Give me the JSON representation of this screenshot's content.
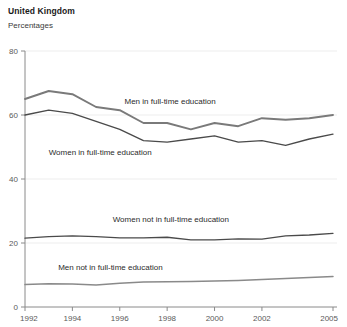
{
  "header": {
    "title": "United Kingdom",
    "subtitle": "Percentages"
  },
  "chart_data": {
    "type": "line",
    "title": "United Kingdom",
    "subtitle": "Percentages",
    "xlabel": "",
    "ylabel": "Percentages",
    "xlim": [
      1992,
      2005
    ],
    "ylim": [
      0,
      80
    ],
    "yticks": [
      0,
      20,
      40,
      60,
      80
    ],
    "xticks": [
      1992,
      1994,
      1996,
      1998,
      2000,
      2002,
      2005
    ],
    "xtick_labels": [
      "1992",
      "1994",
      "1996",
      "1998",
      "2000",
      "2002",
      "2005"
    ],
    "ytick_labels": [
      "0",
      "20",
      "40",
      "60",
      "80"
    ],
    "grid": true,
    "grid_axis": "y",
    "legend_position": "inline-annotations",
    "x": [
      1992,
      1993,
      1994,
      1995,
      1996,
      1997,
      1998,
      1999,
      2000,
      2001,
      2002,
      2003,
      2004,
      2005
    ],
    "series": [
      {
        "name": "Men in full-time education",
        "color": "#7a7a7a",
        "width": 1.9,
        "label_x": 1996.2,
        "label_y": 63.5,
        "values": [
          65,
          67.5,
          66.5,
          62.5,
          61.5,
          57.5,
          57.5,
          55.5,
          57.5,
          56.5,
          59,
          58.5,
          59,
          60
        ]
      },
      {
        "name": "Women in full-time education",
        "color": "#4a4a4a",
        "width": 1.3,
        "label_x": 1993.0,
        "label_y": 47.5,
        "values": [
          60,
          61.5,
          60.5,
          58,
          55.5,
          52,
          51.5,
          52.5,
          53.5,
          51.5,
          52,
          50.5,
          52.5,
          54
        ]
      },
      {
        "name": "Women not in full-time education",
        "color": "#4a4a4a",
        "width": 1.3,
        "label_x": 1995.7,
        "label_y": 26.5,
        "values": [
          21.5,
          22,
          22.2,
          22,
          21.6,
          21.6,
          21.8,
          21,
          21,
          21.3,
          21.2,
          22.2,
          22.5,
          23
        ]
      },
      {
        "name": "Men not in full-time education",
        "color": "#8a8a8a",
        "width": 1.5,
        "label_x": 1993.4,
        "label_y": 11.5,
        "values": [
          7,
          7.3,
          7.2,
          6.9,
          7.4,
          7.8,
          7.9,
          8.0,
          8.1,
          8.3,
          8.6,
          8.9,
          9.2,
          9.5
        ]
      }
    ]
  },
  "colors": {
    "axis": "#8a8a8a",
    "grid": "#ededed",
    "text": "#5a5a5a",
    "title": "#1a1a1a"
  }
}
